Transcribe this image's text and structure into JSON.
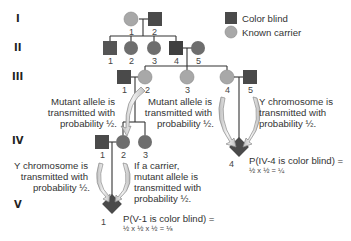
{
  "legend": {
    "color_blind": "Color blind",
    "known_carrier": "Known carrier"
  },
  "colors": {
    "color_blind": "#4a4a4a",
    "known_carrier": "#a8a8a8",
    "unaffected_female": "#6e6e6e",
    "arrow_fill": "#d9d9d9",
    "line": "#333333"
  },
  "generations": [
    "I",
    "II",
    "III",
    "IV",
    "V"
  ],
  "individuals": {
    "I": [
      {
        "id": "1",
        "sex": "female",
        "status": "carrier"
      },
      {
        "id": "2",
        "sex": "male",
        "status": "color_blind"
      }
    ],
    "II": [
      {
        "id": "1",
        "sex": "male",
        "status": "color_blind"
      },
      {
        "id": "2",
        "sex": "female",
        "status": "unaffected"
      },
      {
        "id": "3",
        "sex": "female",
        "status": "unaffected"
      },
      {
        "id": "4",
        "sex": "male",
        "status": "color_blind"
      },
      {
        "id": "5",
        "sex": "female",
        "status": "unaffected"
      }
    ],
    "III": [
      {
        "id": "1",
        "sex": "male",
        "status": "color_blind"
      },
      {
        "id": "2",
        "sex": "female",
        "status": "carrier"
      },
      {
        "id": "3",
        "sex": "female",
        "status": "carrier"
      },
      {
        "id": "4",
        "sex": "female",
        "status": "carrier"
      },
      {
        "id": "5",
        "sex": "male",
        "status": "color_blind"
      }
    ],
    "IV": [
      {
        "id": "1",
        "sex": "male",
        "status": "color_blind"
      },
      {
        "id": "2",
        "sex": "female",
        "status": "unaffected"
      },
      {
        "id": "3",
        "sex": "female",
        "status": "unaffected"
      },
      {
        "id": "4",
        "sex": "unknown",
        "status": "color_blind"
      }
    ],
    "V": [
      {
        "id": "1",
        "sex": "unknown",
        "status": "color_blind"
      }
    ]
  },
  "annotations": {
    "iii2_to_iv": [
      "Mutant allele is",
      "transmitted with",
      "probability ½."
    ],
    "iii4_to_iv4": [
      "Mutant allele is",
      "transmitted with",
      "probability ½."
    ],
    "iii5_to_iv4": [
      "Y chromosome is",
      "transmitted with",
      "probability ½."
    ],
    "iv1_to_v1": [
      "Y chromosome is",
      "transmitted with",
      "probability ½."
    ],
    "iv2_to_v1": [
      "If a carrier,",
      "mutant allele is",
      "transmitted with",
      "probability ½."
    ],
    "p_iv4": {
      "line1": "P(IV-4 is color blind) =",
      "line2": "½ x ½ = ¼"
    },
    "p_v1": {
      "line1": "P(V-1 is color blind) =",
      "line2": "½ x ½ x ½ = ⅛"
    }
  }
}
